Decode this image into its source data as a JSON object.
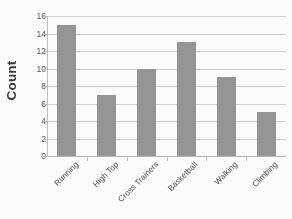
{
  "chart_data": {
    "type": "bar",
    "title": "",
    "subtitle": "",
    "xlabel": "",
    "ylabel": "Count",
    "categories": [
      "Running",
      "High Top",
      "Cross Trainers",
      "Basketball",
      "Walking",
      "Climbing"
    ],
    "values": [
      15,
      7,
      10,
      13,
      9,
      5
    ],
    "ylim": [
      0,
      16
    ],
    "y_ticks": [
      0,
      2,
      4,
      6,
      8,
      10,
      12,
      14,
      16
    ],
    "y_tick_labels": [
      "0",
      "2",
      "4",
      "6",
      "8",
      "10",
      "12",
      "14",
      "16"
    ],
    "grid": "horizontal",
    "legend": "none",
    "bar_color": "#969696",
    "gridline_color": "#d4d4d4",
    "axis_color": "#bfbfbf",
    "annotations": []
  }
}
